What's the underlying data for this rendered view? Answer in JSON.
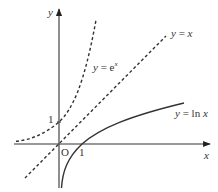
{
  "axes": {
    "x_label": "x",
    "y_label": "y",
    "origin_label": "O",
    "x_tick_label": "1",
    "y_tick_label": "1"
  },
  "curves": [
    {
      "name": "exp",
      "label_prefix": "y = e",
      "label_sup": "x",
      "style": "dashed"
    },
    {
      "name": "identity",
      "label": "y = x",
      "style": "dashed"
    },
    {
      "name": "log",
      "label": "y = ln x",
      "style": "solid"
    }
  ],
  "colors": {
    "stroke": "#333333",
    "background": "#ffffff"
  }
}
